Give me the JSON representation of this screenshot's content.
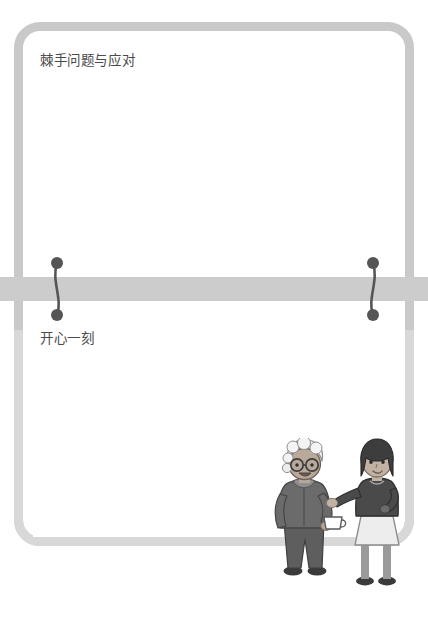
{
  "slide": {
    "background_color": "#ffffff",
    "frame_color": "#c9c9c9",
    "frame_color_lower": "#d8d8d8",
    "card_color": "#ffffff",
    "divider_band_color": "#cccccc",
    "connector_dot_color": "#555555",
    "text_color": "#4a4a4a"
  },
  "sections": {
    "top": {
      "label": "棘手问题与应对",
      "content": ""
    },
    "bottom": {
      "label": "开心一刻",
      "content": ""
    }
  },
  "connectors": {
    "left": {
      "name": "left-connector"
    },
    "right": {
      "name": "right-connector"
    }
  },
  "illustration": {
    "name": "two-women-conversation-illustration",
    "characters": [
      {
        "name": "elderly-woman",
        "hair": "white-curly",
        "glasses": true,
        "holding": "cup",
        "top_color": "#6b6b6b",
        "pants_color": "#5e5e5e",
        "shoes_color": "#3a3a3a",
        "skin_color": "#b9a99a"
      },
      {
        "name": "young-woman",
        "hair": "dark-bob",
        "glasses": false,
        "top_color": "#4a4a4a",
        "skirt_color": "#ededed",
        "legs_color": "#9a9a9a",
        "shoes_color": "#3a3a3a",
        "skin_color": "#c2b2a4"
      }
    ]
  }
}
